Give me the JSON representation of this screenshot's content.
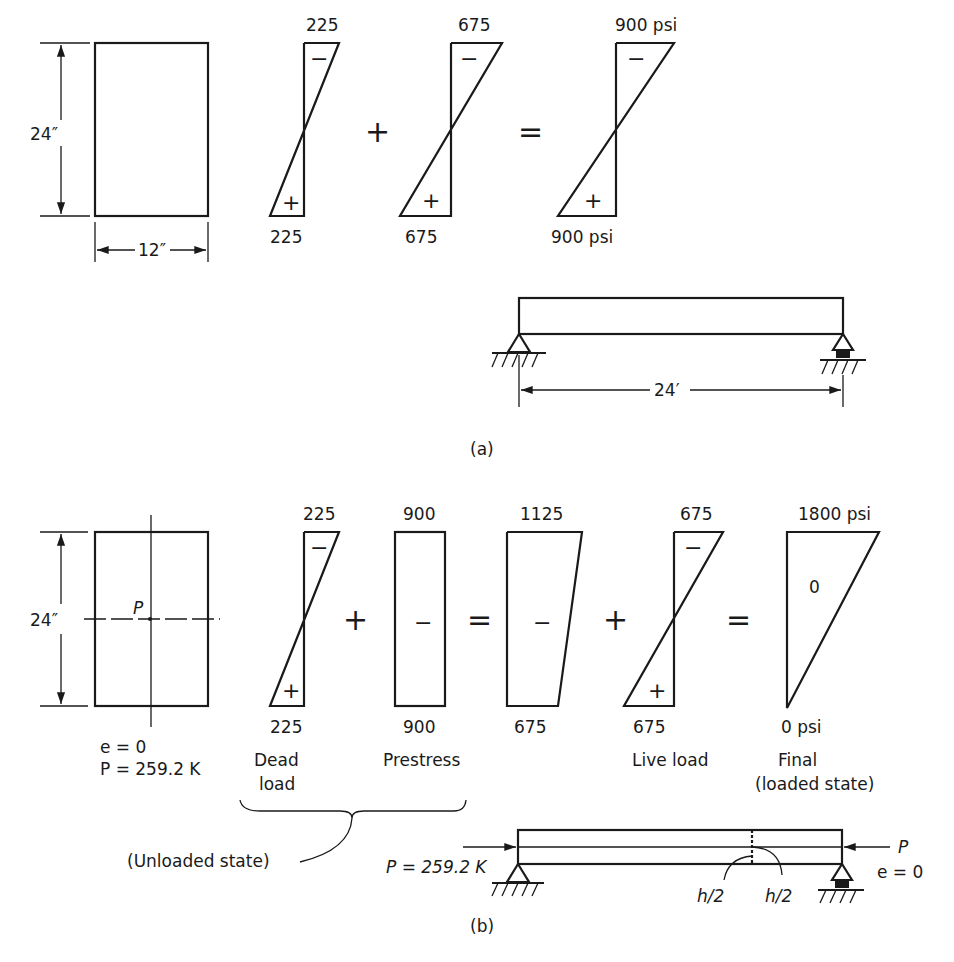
{
  "part_a": {
    "section": {
      "height_label": "24″",
      "width_label": "12″"
    },
    "diagrams": [
      {
        "top": "225",
        "bottom": "225",
        "top_sign": "−",
        "bottom_sign": "+"
      },
      {
        "top": "675",
        "bottom": "675",
        "top_sign": "−",
        "bottom_sign": "+"
      },
      {
        "top": "900 psi",
        "bottom": "900 psi",
        "top_sign": "−",
        "bottom_sign": "+"
      }
    ],
    "operators": [
      "+",
      "="
    ],
    "beam": {
      "span_label": "24′"
    },
    "label": "(a)"
  },
  "part_b": {
    "section": {
      "height_label": "24″",
      "load_point_label": "P",
      "eccentricity": "e = 0",
      "force": "P = 259.2 K"
    },
    "diagrams": [
      {
        "top": "225",
        "bottom": "225",
        "top_sign": "−",
        "bottom_sign": "+",
        "caption_line1": "Dead",
        "caption_line2": "load"
      },
      {
        "top": "900",
        "bottom": "900",
        "center_sign": "−",
        "caption_line1": "Prestress"
      },
      {
        "top": "1125",
        "bottom": "675",
        "center_sign": "−"
      },
      {
        "top": "675",
        "bottom": "675",
        "top_sign": "−",
        "bottom_sign": "+",
        "caption_line1": "Live load"
      },
      {
        "top": "1800 psi",
        "bottom": "0 psi",
        "center_sign": "0",
        "caption_line1": "Final",
        "caption_line2": "(loaded state)"
      }
    ],
    "operators": [
      "+",
      "=",
      "+",
      "="
    ],
    "brace_label": "(Unloaded state)",
    "beam": {
      "force_left": "P = 259.2 K",
      "force_right": "P",
      "eccentricity_right": "e = 0",
      "half_depth_left": "h/2",
      "half_depth_right": "h/2"
    },
    "label": "(b)"
  }
}
